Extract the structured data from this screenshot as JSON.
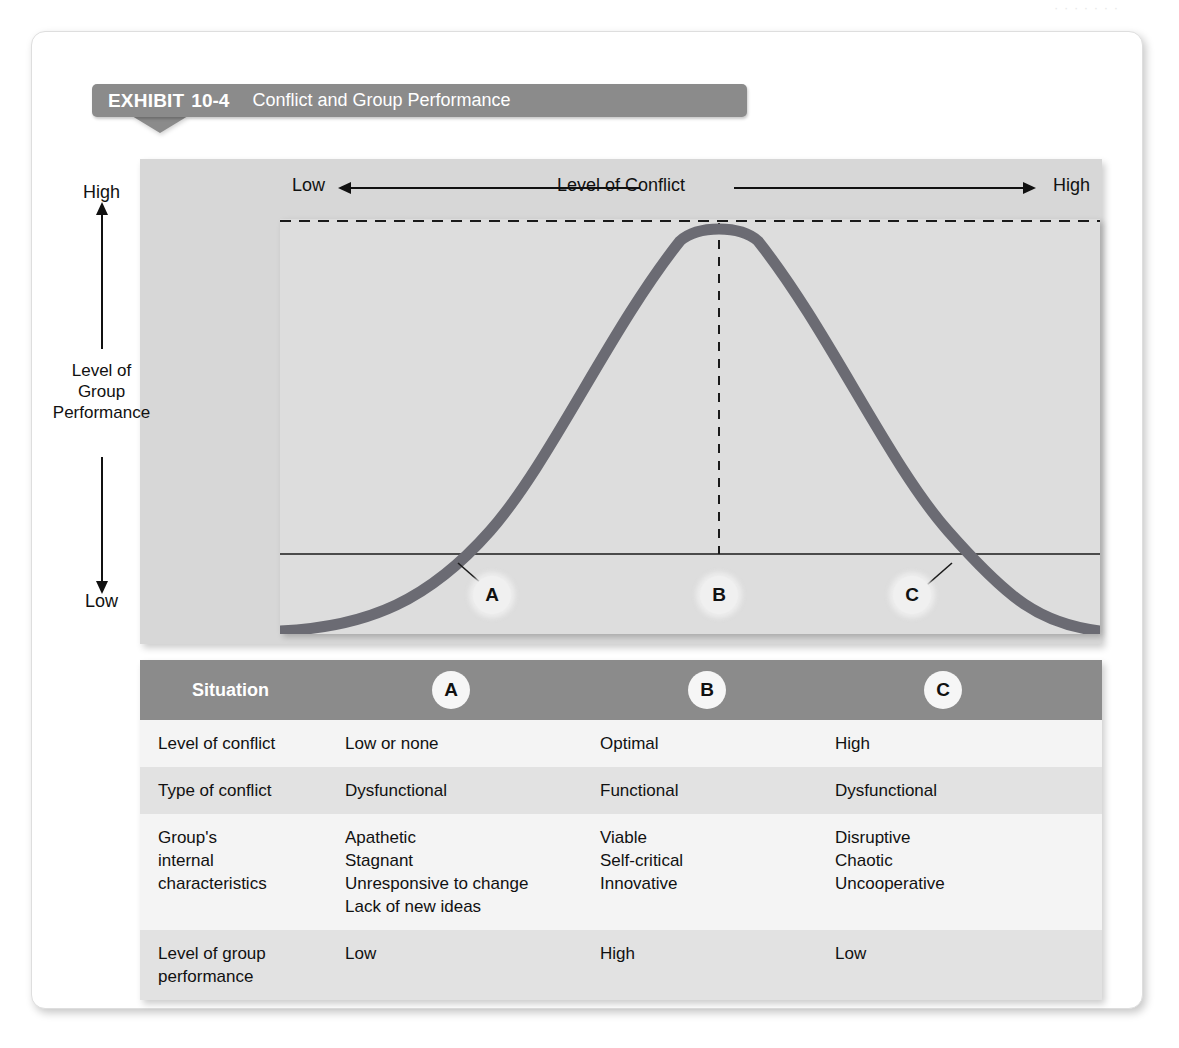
{
  "page": {
    "ghost_header": "· · · · · · ·"
  },
  "exhibit": {
    "label": "EXHIBIT",
    "number": "10-4",
    "title": "Conflict and Group Performance"
  },
  "chart_axes": {
    "x_left_label": "Low",
    "x_title": "Level of Conflict",
    "x_right_label": "High",
    "y_top_label": "High",
    "y_title_line1": "Level of",
    "y_title_line2": "Group",
    "y_title_line3": "Performance",
    "y_bottom_label": "Low"
  },
  "markers": {
    "a": "A",
    "b": "B",
    "c": "C"
  },
  "colors": {
    "curve": "#6b6b73",
    "band": "#8b8b8b",
    "panel": "#d7d7d7",
    "plot": "#dddddd",
    "row_alt": "#e2e2e2",
    "row_plain": "#f4f4f4"
  },
  "chart_data": {
    "type": "line",
    "title": "Conflict and Group Performance",
    "xlabel": "Level of Conflict",
    "ylabel": "Level of Group Performance",
    "xlim": [
      "Low",
      "High"
    ],
    "ylim": [
      "Low",
      "High"
    ],
    "grid": false,
    "legend": "none",
    "annotations": [
      {
        "id": "A",
        "x_frac": 0.21,
        "label": "Low or none conflict / low performance"
      },
      {
        "id": "B",
        "x_frac": 0.535,
        "label": "Optimal conflict / high performance"
      },
      {
        "id": "C",
        "x_frac": 0.82,
        "label": "High conflict / low performance"
      }
    ],
    "reference_lines": [
      {
        "type": "horizontal-dashed",
        "y_frac": 1.0,
        "note": "peak performance level"
      },
      {
        "type": "vertical-dashed",
        "x_frac": 0.535,
        "note": "optimal conflict point"
      },
      {
        "type": "horizontal-solid",
        "y_frac": 0.19,
        "note": "threshold performance line"
      }
    ],
    "series": [
      {
        "name": "Group performance",
        "x": [
          0.0,
          0.05,
          0.1,
          0.15,
          0.2,
          0.25,
          0.3,
          0.35,
          0.4,
          0.45,
          0.5,
          0.535,
          0.6,
          0.65,
          0.7,
          0.75,
          0.8,
          0.85,
          0.9,
          0.95,
          1.0
        ],
        "y": [
          0.0,
          0.02,
          0.06,
          0.12,
          0.21,
          0.33,
          0.47,
          0.62,
          0.76,
          0.88,
          0.97,
          1.0,
          0.96,
          0.89,
          0.79,
          0.66,
          0.51,
          0.36,
          0.22,
          0.11,
          0.02
        ]
      }
    ]
  },
  "table": {
    "header": {
      "situation": "Situation",
      "col_a": "A",
      "col_b": "B",
      "col_c": "C"
    },
    "rows": [
      {
        "label": "Level of conflict",
        "a": "Low or none",
        "b": "Optimal",
        "c": "High"
      },
      {
        "label": "Type of conflict",
        "a": "Dysfunctional",
        "b": "Functional",
        "c": "Dysfunctional"
      },
      {
        "label": "Group's\ninternal\ncharacteristics",
        "a": "Apathetic\nStagnant\nUnresponsive to change\nLack of new ideas",
        "b": "Viable\nSelf-critical\nInnovative",
        "c": "Disruptive\nChaotic\nUncooperative"
      },
      {
        "label": "Level of group\nperformance",
        "a": "Low",
        "b": "High",
        "c": "Low"
      }
    ]
  }
}
